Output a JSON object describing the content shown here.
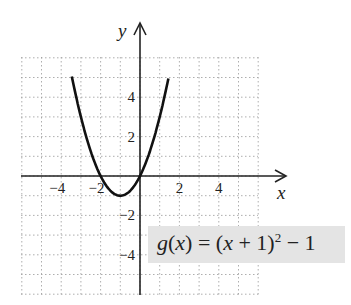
{
  "chart_data": {
    "type": "line",
    "title": "",
    "xlabel": "x",
    "ylabel": "y",
    "function": "g(x) = (x + 1)^2 - 1",
    "xlim": [
      -6,
      6
    ],
    "ylim": [
      -6,
      6
    ],
    "x_ticks": [
      -4,
      -2,
      2,
      4
    ],
    "y_ticks": [
      4,
      2,
      -2,
      -4
    ],
    "grid": true,
    "vertex": [
      -1,
      -1
    ],
    "x_intercepts": [
      -2,
      0
    ],
    "series": [
      {
        "name": "g(x)",
        "x": [
          -3.45,
          -3,
          -2,
          -1,
          0,
          1,
          1.45
        ],
        "y": [
          5,
          3,
          0,
          -1,
          0,
          3,
          5
        ]
      }
    ],
    "annotation": "g(x) = (x + 1)^2 - 1"
  },
  "labels": {
    "x_axis": "x",
    "y_axis": "y",
    "x_ticks": [
      "−4",
      "−2",
      "2",
      "4"
    ],
    "y_ticks": [
      "4",
      "2",
      "−2",
      "−4"
    ],
    "equation": {
      "lhs": "g(x) = (x + 1)",
      "exp": "2",
      "rhs": " − 1"
    }
  }
}
